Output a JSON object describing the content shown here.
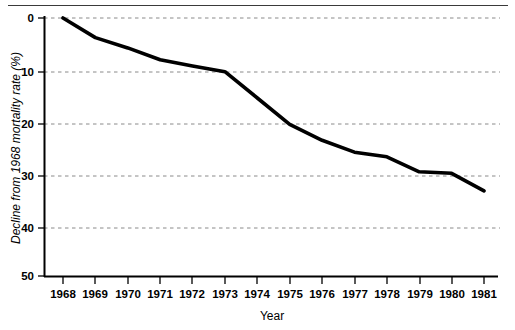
{
  "figure": {
    "divider": "top-horizontal-rule"
  },
  "chart_data": {
    "type": "line",
    "title": "",
    "xlabel": "Year",
    "ylabel": "Decline from 1968 mortality rate (%)",
    "x": [
      1968,
      1969,
      1970,
      1971,
      1972,
      1973,
      1974,
      1975,
      1976,
      1977,
      1978,
      1979,
      1980,
      1981
    ],
    "categories": [
      "1968",
      "1969",
      "1970",
      "1971",
      "1972",
      "1973",
      "1974",
      "1975",
      "1976",
      "1977",
      "1978",
      "1979",
      "1980",
      "1981"
    ],
    "values": [
      0.0,
      3.8,
      5.8,
      8.1,
      9.3,
      10.4,
      15.5,
      20.6,
      23.7,
      26.0,
      26.9,
      29.8,
      30.1,
      33.5
    ],
    "series": [
      {
        "name": "Decline from 1968 mortality rate",
        "values": [
          0.0,
          3.8,
          5.8,
          8.1,
          9.3,
          10.4,
          15.5,
          20.6,
          23.7,
          26.0,
          26.9,
          29.8,
          30.1,
          33.5
        ]
      }
    ],
    "xtick_labels": [
      "1968",
      "1969",
      "1970",
      "1971",
      "1972",
      "1973",
      "1974",
      "1975",
      "1976",
      "1977",
      "1978",
      "1979",
      "1980",
      "1981"
    ],
    "ytick_labels": [
      "0",
      "10",
      "20",
      "30",
      "40",
      "50"
    ],
    "ytick_values": [
      0,
      10,
      20,
      30,
      40,
      50
    ],
    "ylim": [
      0,
      50
    ],
    "y_axis_inverted": true,
    "xlim": [
      1968,
      1981
    ],
    "grid": "horizontal-dashed",
    "legend": "none",
    "line_color": "#000000",
    "grid_color": "#808080",
    "axis_color": "#000000"
  }
}
